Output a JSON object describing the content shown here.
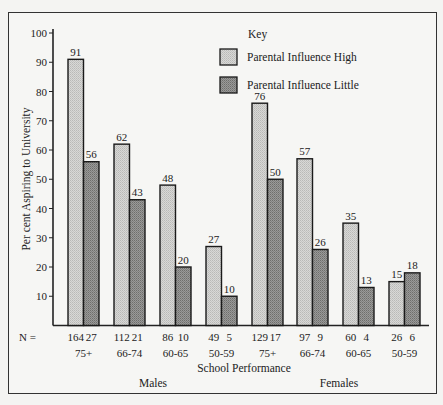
{
  "chart_data": {
    "type": "bar",
    "title": "",
    "xlabel": "School Performance",
    "ylabel": "Per cent Aspiring to University",
    "ylim": [
      0,
      100
    ],
    "yticks": [
      10,
      20,
      30,
      40,
      50,
      60,
      70,
      80,
      90,
      100
    ],
    "grid": false,
    "legend_title": "Key",
    "legend_position": "upper right",
    "groups": [
      "Males",
      "Females"
    ],
    "categories": [
      "75+",
      "66-74",
      "60-65",
      "50-59",
      "75+",
      "66-74",
      "60-65",
      "50-59"
    ],
    "category_groups": [
      "Males",
      "Males",
      "Males",
      "Males",
      "Females",
      "Females",
      "Females",
      "Females"
    ],
    "series": [
      {
        "name": "Parental Influence High",
        "values": [
          91,
          62,
          48,
          27,
          76,
          57,
          35,
          15
        ],
        "n": [
          164,
          112,
          86,
          49,
          129,
          97,
          60,
          26
        ],
        "color": "#cfcfcf"
      },
      {
        "name": "Parental Influence Little",
        "values": [
          56,
          43,
          20,
          10,
          50,
          26,
          13,
          18
        ],
        "n": [
          27,
          21,
          10,
          5,
          17,
          9,
          4,
          6
        ],
        "color": "#8c8c8c"
      }
    ],
    "n_label": "N ="
  }
}
